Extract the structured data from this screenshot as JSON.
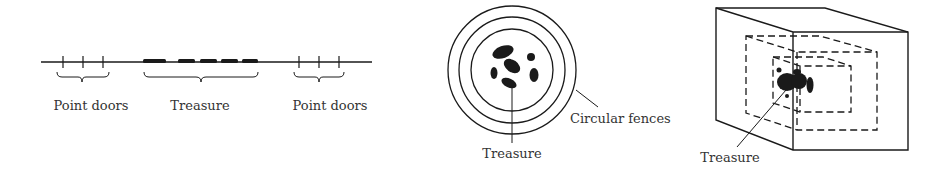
{
  "figure": {
    "panel_1d": {
      "labels": {
        "left": "Point doors",
        "center": "Treasure",
        "right": "Point doors"
      }
    },
    "panel_2d": {
      "labels": {
        "fences": "Circular fences",
        "treasure": "Treasure"
      }
    },
    "panel_3d": {
      "labels": {
        "treasure": "Treasure"
      }
    },
    "colors": {
      "ink": "#1a1a1a",
      "text": "#333333",
      "background": "#ffffff"
    }
  }
}
